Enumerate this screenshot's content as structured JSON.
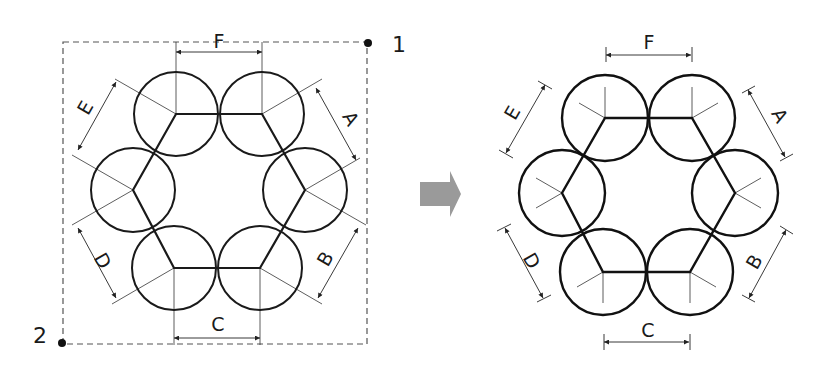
{
  "figure": {
    "colors": {
      "stroke": "#1a1a1a",
      "thin": "#333333",
      "dashed": "#555555",
      "arrow": "#9a9a9a"
    }
  },
  "left_diagram": {
    "selection_box": {
      "corner_1_label": "1",
      "corner_2_label": "2"
    },
    "dimensions": {
      "A": "A",
      "B": "B",
      "C": "C",
      "D": "D",
      "E": "E",
      "F": "F"
    },
    "circle_count": 6
  },
  "transition_arrow": {
    "icon": "right-arrow-icon"
  },
  "right_diagram": {
    "dimensions": {
      "A": "A",
      "B": "B",
      "C": "C",
      "D": "D",
      "E": "E",
      "F": "F"
    },
    "circle_count": 6
  }
}
